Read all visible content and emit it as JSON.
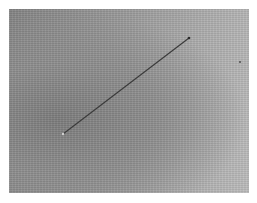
{
  "image": {
    "description": "Grayscale textured surface photograph with a thin dark diagonal line",
    "colors": {
      "dark_side": "#858585",
      "light_side": "#bdbdbd",
      "line": "#3a3a3a",
      "background": "#ffffff"
    },
    "line": {
      "x1": 63,
      "y1": 134,
      "x2": 189,
      "y2": 38
    },
    "speck": {
      "x": 240,
      "y": 62
    }
  }
}
